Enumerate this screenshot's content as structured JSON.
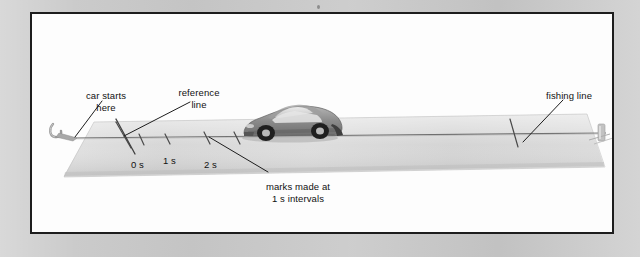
{
  "figure": {
    "background_color": "#c8c8c8",
    "panel_color": "#fdfdfd",
    "frame_color": "#1d1d1d",
    "strip_color": "#d8d8d8",
    "line_color": "#6b6b6b",
    "text_color": "#111111",
    "labels": {
      "car_starts_here": "car starts\nhere",
      "car_starts_here_line1": "car starts",
      "car_starts_here_line2": "here",
      "reference_line": "reference\nline",
      "reference_line_line1": "reference",
      "reference_line_line2": "line",
      "fishing_line": "fishing line",
      "marks_made_at_line1": "marks made at",
      "marks_made_at_line2": "1 s intervals"
    },
    "time_marks": [
      {
        "label": "0 s",
        "x": 108
      },
      {
        "label": "1 s",
        "x": 140
      },
      {
        "label": "2 s",
        "x": 181
      }
    ],
    "tick_count_visible": 5,
    "objects": [
      {
        "name": "hook",
        "description": "small hook at left end of fishing line"
      },
      {
        "name": "toy-car",
        "description": "grey toy sports car facing right"
      },
      {
        "name": "peg",
        "description": "small clamp/peg anchoring line at right end"
      }
    ]
  }
}
